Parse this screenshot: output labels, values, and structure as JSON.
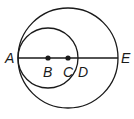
{
  "diagram": {
    "type": "geometry",
    "large_circle": {
      "center": "C",
      "cx": 68,
      "cy": 58,
      "r": 50
    },
    "small_circle": {
      "center": "B",
      "cx": 48,
      "cy": 58,
      "r": 30
    },
    "segment": {
      "from": "A",
      "to": "E"
    },
    "points": [
      {
        "label": "A",
        "x": 18,
        "y": 58,
        "dot": false
      },
      {
        "label": "B",
        "x": 48,
        "y": 58,
        "dot": true
      },
      {
        "label": "C",
        "x": 68,
        "y": 58,
        "dot": true
      },
      {
        "label": "D",
        "x": 78,
        "y": 58,
        "dot": false
      },
      {
        "label": "E",
        "x": 118,
        "y": 58,
        "dot": false
      }
    ],
    "labels": {
      "A": "A",
      "B": "B",
      "C": "C",
      "D": "D",
      "E": "E"
    },
    "stroke_color": "#1a1a1a"
  }
}
